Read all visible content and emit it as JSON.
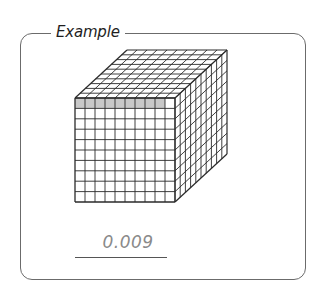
{
  "title": "Example",
  "answer": "0.009",
  "colors": {
    "border": "#6b6b6b",
    "grid_line": "#2a2a2a",
    "shaded_cell": "#c8c8c8",
    "answer_text": "#8a8a8a"
  },
  "cube": {
    "dimensions": [
      10,
      10,
      10
    ],
    "shaded_cells_top_row": 9,
    "description": "10x10x10 grid cube (1000 small cubes); 9 cells of the front top row shaded"
  }
}
